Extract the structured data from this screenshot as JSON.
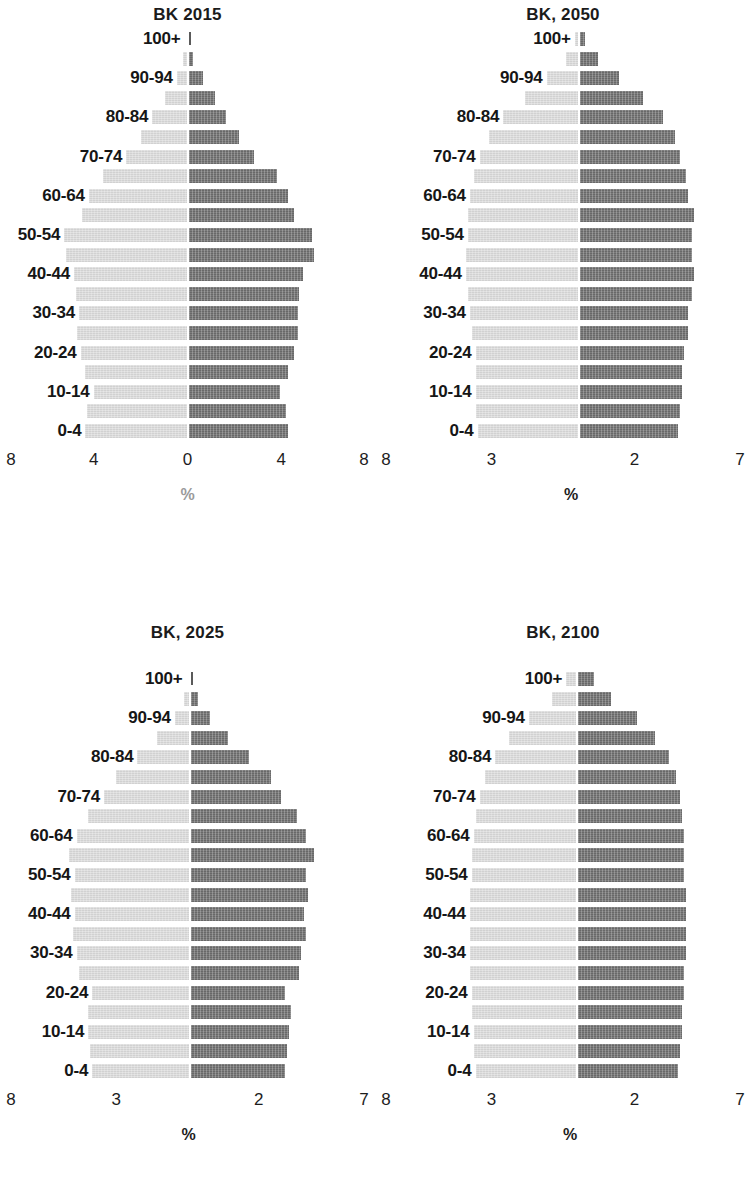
{
  "figure": {
    "age_groups": [
      "0-4",
      "5-9",
      "10-14",
      "15-19",
      "20-24",
      "25-29",
      "30-34",
      "35-39",
      "40-44",
      "45-49",
      "50-54",
      "55-59",
      "60-64",
      "65-69",
      "70-74",
      "75-79",
      "80-84",
      "85-89",
      "90-94",
      "95-99",
      "100+"
    ],
    "visible_age_labels": [
      "0-4",
      "10-14",
      "20-24",
      "30-34",
      "40-44",
      "50-54",
      "60-64",
      "70-74",
      "80-84",
      "90-94",
      "100+"
    ],
    "series_names": [
      "Male",
      "Female"
    ],
    "colors": {
      "left_bar": "#dcdcdc",
      "right_bar": "#6e6e6e",
      "text": "#1a1a1a",
      "muted_text": "#9a9a9a",
      "background": "#ffffff"
    },
    "axis_unit_label": "%"
  },
  "chart_data": [
    {
      "type": "bar",
      "title": "BK 2015",
      "orientation": "population-pyramid",
      "xlabel": "%",
      "ylabel": "",
      "grid": false,
      "legend": "none",
      "categories": [
        "0-4",
        "5-9",
        "10-14",
        "15-19",
        "20-24",
        "25-29",
        "30-34",
        "35-39",
        "40-44",
        "45-49",
        "50-54",
        "55-59",
        "60-64",
        "65-69",
        "70-74",
        "75-79",
        "80-84",
        "85-89",
        "90-94",
        "95-99",
        "100+"
      ],
      "tick_labels": [
        "8",
        "4",
        "0",
        "4",
        "8"
      ],
      "tick_positions_pct": [
        0,
        25,
        50,
        75,
        100
      ],
      "axis_range": [
        -8,
        8
      ],
      "unit_label_color": "#9a9a9a",
      "series": [
        {
          "name": "Male",
          "side": "left",
          "values": [
            3.1,
            3.05,
            2.85,
            3.1,
            3.25,
            3.35,
            3.3,
            3.4,
            3.45,
            3.7,
            3.75,
            3.2,
            3.0,
            2.55,
            1.85,
            1.4,
            1.05,
            0.65,
            0.3,
            0.1,
            0.02
          ]
        },
        {
          "name": "Female",
          "side": "right",
          "values": [
            3.05,
            3.0,
            2.8,
            3.05,
            3.25,
            3.35,
            3.35,
            3.4,
            3.5,
            3.85,
            3.8,
            3.25,
            3.05,
            2.7,
            2.0,
            1.55,
            1.15,
            0.8,
            0.45,
            0.15,
            0.03
          ]
        }
      ]
    },
    {
      "type": "bar",
      "title": "BK, 2050",
      "orientation": "population-pyramid",
      "xlabel": "%",
      "ylabel": "",
      "grid": false,
      "legend": "none",
      "categories": [
        "0-4",
        "5-9",
        "10-14",
        "15-19",
        "20-24",
        "25-29",
        "30-34",
        "35-39",
        "40-44",
        "45-49",
        "50-54",
        "55-59",
        "60-64",
        "65-69",
        "70-74",
        "75-79",
        "80-84",
        "85-89",
        "90-94",
        "95-99",
        "100+"
      ],
      "tick_labels": [
        "8",
        "3",
        "2",
        "7"
      ],
      "tick_positions_pct": [
        0,
        31,
        69,
        100
      ],
      "axis_range": [
        -8,
        7
      ],
      "unit_label_color": "#1d1d1d",
      "series": [
        {
          "name": "Male",
          "side": "left",
          "values": [
            2.55,
            2.6,
            2.6,
            2.6,
            2.6,
            2.7,
            2.75,
            2.8,
            2.85,
            2.85,
            2.8,
            2.8,
            2.75,
            2.65,
            2.5,
            2.25,
            1.9,
            1.35,
            0.8,
            0.3,
            0.08
          ]
        },
        {
          "name": "Female",
          "side": "right",
          "values": [
            2.5,
            2.55,
            2.6,
            2.6,
            2.65,
            2.75,
            2.75,
            2.85,
            2.9,
            2.85,
            2.85,
            2.9,
            2.75,
            2.7,
            2.55,
            2.4,
            2.1,
            1.6,
            1.0,
            0.45,
            0.12
          ]
        }
      ]
    },
    {
      "type": "bar",
      "title": "BK, 2025",
      "orientation": "population-pyramid",
      "xlabel": "%",
      "ylabel": "",
      "grid": false,
      "legend": "none",
      "categories": [
        "0-4",
        "5-9",
        "10-14",
        "15-19",
        "20-24",
        "25-29",
        "30-34",
        "35-39",
        "40-44",
        "45-49",
        "50-54",
        "55-59",
        "60-64",
        "65-69",
        "70-74",
        "75-79",
        "80-84",
        "85-89",
        "90-94",
        "95-99",
        "100+"
      ],
      "tick_labels": [
        "8",
        "3",
        "2",
        "7"
      ],
      "tick_positions_pct": [
        0,
        31,
        69,
        100
      ],
      "axis_range": [
        -8,
        7
      ],
      "unit_label_color": "#1d1d1d",
      "series": [
        {
          "name": "Male",
          "side": "left",
          "values": [
            2.45,
            2.5,
            2.55,
            2.55,
            2.45,
            2.8,
            2.85,
            2.95,
            2.9,
            3.0,
            2.9,
            3.05,
            2.85,
            2.55,
            2.15,
            1.85,
            1.3,
            0.8,
            0.35,
            0.12,
            0.02
          ]
        },
        {
          "name": "Female",
          "side": "right",
          "values": [
            2.4,
            2.45,
            2.5,
            2.55,
            2.4,
            2.75,
            2.8,
            2.95,
            2.9,
            3.0,
            2.95,
            3.15,
            2.95,
            2.7,
            2.3,
            2.05,
            1.5,
            0.95,
            0.5,
            0.18,
            0.03
          ]
        }
      ]
    },
    {
      "type": "bar",
      "title": "BK, 2100",
      "orientation": "population-pyramid",
      "xlabel": "%",
      "ylabel": "",
      "grid": false,
      "legend": "none",
      "categories": [
        "0-4",
        "5-9",
        "10-14",
        "15-19",
        "20-24",
        "25-29",
        "30-34",
        "35-39",
        "40-44",
        "45-49",
        "50-54",
        "55-59",
        "60-64",
        "65-69",
        "70-74",
        "75-79",
        "80-84",
        "85-89",
        "90-94",
        "95-99",
        "100+"
      ],
      "tick_labels": [
        "8",
        "3",
        "2",
        "7"
      ],
      "tick_positions_pct": [
        0,
        31,
        69,
        100
      ],
      "axis_range": [
        -8,
        7
      ],
      "unit_label_color": "#1d1d1d",
      "series": [
        {
          "name": "Male",
          "side": "left",
          "values": [
            2.55,
            2.6,
            2.6,
            2.65,
            2.65,
            2.7,
            2.7,
            2.7,
            2.7,
            2.7,
            2.65,
            2.65,
            2.6,
            2.55,
            2.45,
            2.3,
            2.05,
            1.7,
            1.2,
            0.6,
            0.25
          ]
        },
        {
          "name": "Female",
          "side": "right",
          "values": [
            2.55,
            2.6,
            2.65,
            2.65,
            2.7,
            2.7,
            2.75,
            2.75,
            2.75,
            2.75,
            2.7,
            2.7,
            2.7,
            2.65,
            2.6,
            2.5,
            2.3,
            1.95,
            1.5,
            0.85,
            0.4
          ]
        }
      ]
    }
  ]
}
